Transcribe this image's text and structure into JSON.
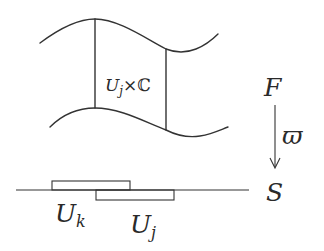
{
  "diagram": {
    "type": "fiber-bundle-local-trivialization",
    "colors": {
      "stroke": "#333333",
      "text": "#2a2a2a",
      "background": "#ffffff"
    },
    "total_space": {
      "label": "F",
      "patch_label": {
        "base": "U",
        "subscript": "j",
        "times": "×",
        "fiber": "ℂ"
      }
    },
    "projection": {
      "label": "ϖ",
      "direction": "down"
    },
    "base_space": {
      "label": "S",
      "open_sets": [
        {
          "base": "U",
          "subscript": "k"
        },
        {
          "base": "U",
          "subscript": "j"
        }
      ]
    }
  }
}
